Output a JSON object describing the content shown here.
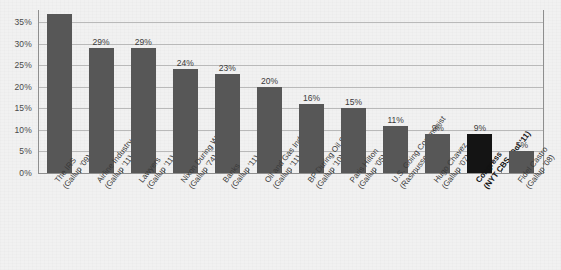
{
  "chart_data": {
    "type": "bar",
    "title": "",
    "subtitle": "",
    "xlabel": "",
    "ylabel": "",
    "ylim": [
      0,
      37
    ],
    "grid": true,
    "legend": "none",
    "y_ticks": [
      "0%",
      "5%",
      "10%",
      "15%",
      "20%",
      "25%",
      "30%",
      "35%"
    ],
    "y_tick_values": [
      0,
      5,
      10,
      15,
      20,
      25,
      30,
      35
    ],
    "categories": [
      "The IRS",
      "Airline Industry",
      "Lawyers",
      "Nixon During Watergate",
      "Banks",
      "Oil and Gas Industry",
      "BP During Oil Spill",
      "Paris Hilton",
      "U.S. Going Communist",
      "Hugo Chavez",
      "Congress",
      "Fidel Castro"
    ],
    "sources": [
      "(Gallup '09)",
      "(Gallup '11)",
      "(Gallup '11)",
      "(Gallup '74)",
      "(Gallup '11)",
      "(Gallup '11)",
      "(Gallup '10)",
      "(Gallup '05)",
      "(Rasmussen '11)",
      "(Gallup '07)",
      "(NYT CBS, Oct '11)",
      "(Gallup '08)"
    ],
    "values": [
      37,
      29,
      29,
      24,
      23,
      20,
      16,
      15,
      11,
      9,
      9,
      5
    ],
    "value_labels": [
      "",
      "29%",
      "29%",
      "24%",
      "23%",
      "20%",
      "16%",
      "15%",
      "11%",
      "9%",
      "9%",
      "5%"
    ],
    "highlight_index": 10,
    "highlight_color": "#141414",
    "bar_color": "#575757",
    "background_color": "#f1f1f1",
    "gridline_color": "#b9b9b9",
    "axis_color": "#8e8e8e"
  }
}
